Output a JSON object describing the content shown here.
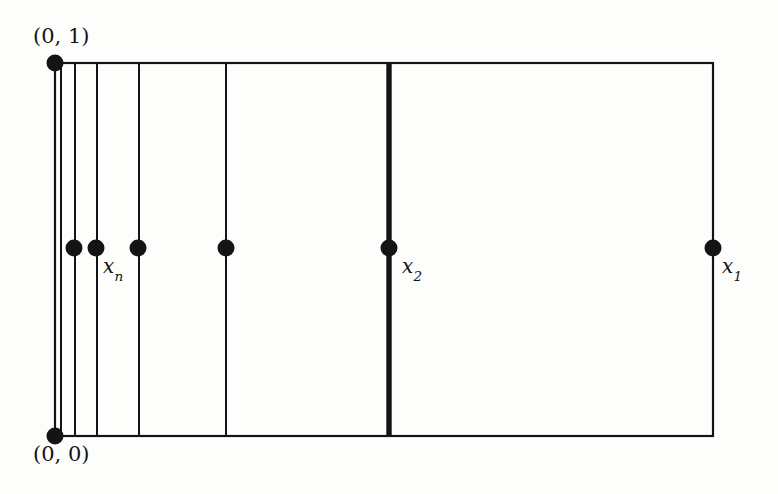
{
  "figure": {
    "background_color": "#fdfdfc",
    "stroke_color": "#141414",
    "point_color": "#141414",
    "canvas": {
      "width": 778,
      "height": 494
    }
  },
  "labels": {
    "top_left_corner": "(0, 1)",
    "bottom_left_corner": "(0, 0)",
    "x_n": "x",
    "x_n_sub": "n",
    "x_2": "x",
    "x_2_sub": "2",
    "x_1": "x",
    "x_1_sub": "1"
  },
  "chart_data": {
    "type": "diagram",
    "xlabel": "",
    "ylabel": "",
    "xlim": [
      0,
      1
    ],
    "ylim": [
      0,
      1
    ],
    "grid": false,
    "legend": "none",
    "rectangle": {
      "name": "unit-square",
      "left_px": 55,
      "right_px": 713,
      "top_px": 63,
      "bottom_px": 436,
      "stroke_width_px": 2.2
    },
    "midline_y_px": 248,
    "vertical_lines": [
      {
        "name": "cut-line-1",
        "x_px": 61,
        "stroke_width_px": 2.0,
        "bold": false
      },
      {
        "name": "cut-line-2",
        "x_px": 75,
        "stroke_width_px": 2.0,
        "bold": false
      },
      {
        "name": "cut-line-3",
        "x_px": 97,
        "stroke_width_px": 2.0,
        "bold": false
      },
      {
        "name": "cut-line-4",
        "x_px": 139,
        "stroke_width_px": 2.0,
        "bold": false
      },
      {
        "name": "cut-line-5",
        "x_px": 226,
        "stroke_width_px": 2.0,
        "bold": false
      },
      {
        "name": "cut-line-x2",
        "x_px": 389,
        "stroke_width_px": 5.4,
        "bold": true
      }
    ],
    "points": [
      {
        "name": "corner-0-1",
        "x_px": 55,
        "y_px": 63,
        "r_px": 8.5,
        "label": "(0, 1)"
      },
      {
        "name": "corner-0-0",
        "x_px": 55,
        "y_px": 436,
        "r_px": 8.5,
        "label": "(0, 0)"
      },
      {
        "name": "point-a",
        "x_px": 74,
        "y_px": 248,
        "r_px": 8.5,
        "label": ""
      },
      {
        "name": "point-xn",
        "x_px": 96,
        "y_px": 248,
        "r_px": 8.5,
        "label": "x_n"
      },
      {
        "name": "point-b",
        "x_px": 138,
        "y_px": 248,
        "r_px": 8.5,
        "label": ""
      },
      {
        "name": "point-c",
        "x_px": 226,
        "y_px": 248,
        "r_px": 8.5,
        "label": ""
      },
      {
        "name": "point-x2",
        "x_px": 389,
        "y_px": 248,
        "r_px": 8.5,
        "label": "x_2"
      },
      {
        "name": "point-x1",
        "x_px": 713,
        "y_px": 248,
        "r_px": 8.5,
        "label": "x_1"
      }
    ]
  }
}
